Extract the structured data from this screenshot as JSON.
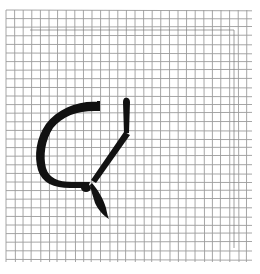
{
  "scene": {
    "description": "Hand-drawn black ink character on gray grid paper",
    "paper_color": "#ffffff",
    "grid_color": "#8a8a8a",
    "ink_color": "#111111",
    "grid": {
      "x_start": 6,
      "x_end": 252,
      "y_start": 10,
      "y_end": 262,
      "spacing": 8.6
    },
    "inner_frame": {
      "x": 30,
      "y": 30,
      "right": 234,
      "bottom": 248
    }
  }
}
